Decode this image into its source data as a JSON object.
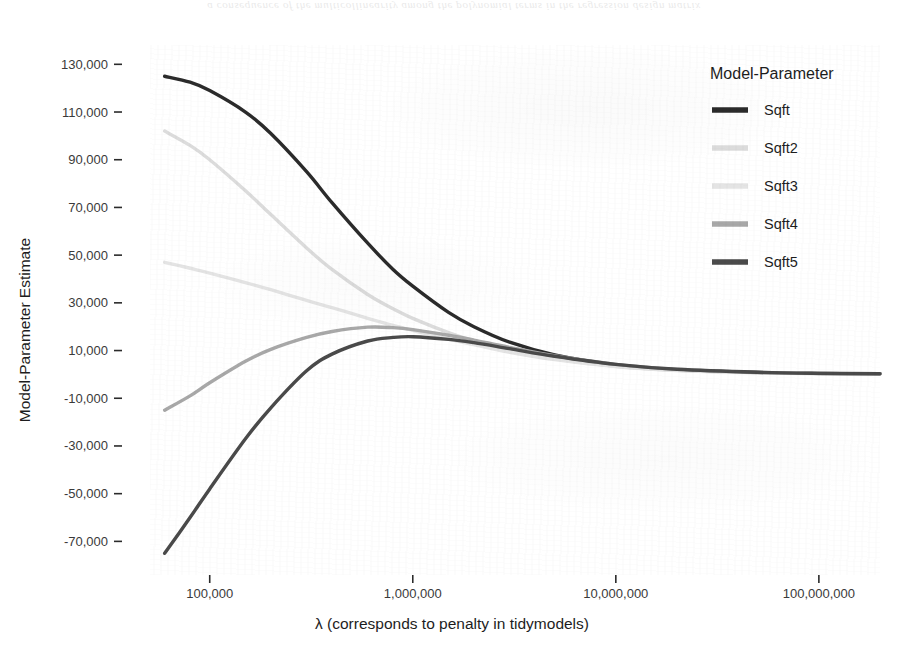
{
  "page": {
    "bleed_through_text": "a consequence of the multicollinearity among the polynomial terms in the regression design matrix"
  },
  "chart_data": {
    "type": "line",
    "title": "",
    "xlabel": "λ (corresponds to penalty in tidymodels)",
    "ylabel": "Model-Parameter Estimate",
    "xscale": "log10",
    "xlim": [
      55000,
      200000000
    ],
    "ylim": [
      -82000,
      136000
    ],
    "x_ticks": [
      100000,
      1000000,
      10000000,
      100000000
    ],
    "x_tick_labels": [
      "100,000",
      "1,000,000",
      "10,000,000",
      "100,000,000"
    ],
    "y_ticks": [
      130000,
      110000,
      90000,
      70000,
      50000,
      30000,
      10000,
      -10000,
      -30000,
      -50000,
      -70000
    ],
    "y_tick_labels": [
      "130,000",
      "110,000",
      "90,000",
      "70,000",
      "50,000",
      "30,000",
      "10,000",
      "-10,000",
      "-30,000",
      "-50,000",
      "-70,000"
    ],
    "grid": false,
    "legend": {
      "title": "Model-Parameter",
      "position": "right",
      "entries": [
        {
          "name": "Sqft",
          "color": "#2b2b2b"
        },
        {
          "name": "Sqft2",
          "color": "#dcdcdc"
        },
        {
          "name": "Sqft3",
          "color": "#e4e4e4"
        },
        {
          "name": "Sqft4",
          "color": "#a8a8a8"
        },
        {
          "name": "Sqft5",
          "color": "#4a4a4a"
        }
      ]
    },
    "x": [
      60000,
      80000,
      100000,
      150000,
      200000,
      300000,
      400000,
      600000,
      800000,
      1000000,
      1500000,
      2000000,
      3000000,
      5000000,
      10000000,
      20000000,
      50000000,
      100000000,
      200000000
    ],
    "series": [
      {
        "name": "Sqft",
        "color": "#2b2b2b",
        "width": 3.4,
        "values": [
          125000,
          122500,
          119000,
          110000,
          101000,
          85000,
          72000,
          55000,
          44000,
          37000,
          26000,
          20000,
          13500,
          8200,
          4000,
          1900,
          800,
          400,
          250
        ]
      },
      {
        "name": "Sqft2",
        "color": "#dcdcdc",
        "width": 3.4,
        "values": [
          102000,
          96000,
          90000,
          77000,
          67000,
          53000,
          44000,
          33500,
          27500,
          23500,
          17500,
          14000,
          10000,
          6500,
          3400,
          1700,
          700,
          350,
          220
        ]
      },
      {
        "name": "Sqft3",
        "color": "#e4e4e4",
        "width": 3.4,
        "values": [
          47000,
          44500,
          42500,
          38500,
          35500,
          31000,
          28000,
          23500,
          20500,
          18500,
          14800,
          12500,
          9300,
          6200,
          3300,
          1650,
          680,
          340,
          210
        ]
      },
      {
        "name": "Sqft4",
        "color": "#a8a8a8",
        "width": 3.4,
        "values": [
          -15000,
          -9000,
          -3500,
          5500,
          10500,
          15500,
          18000,
          19800,
          19600,
          18800,
          16400,
          14400,
          11300,
          7800,
          4200,
          2100,
          850,
          420,
          260
        ]
      },
      {
        "name": "Sqft5",
        "color": "#4a4a4a",
        "width": 3.4,
        "values": [
          -75000,
          -60000,
          -48000,
          -27000,
          -14000,
          1500,
          8500,
          14000,
          15500,
          15800,
          14700,
          13300,
          10800,
          7600,
          4200,
          2150,
          880,
          440,
          270
        ]
      }
    ],
    "annotations": []
  }
}
